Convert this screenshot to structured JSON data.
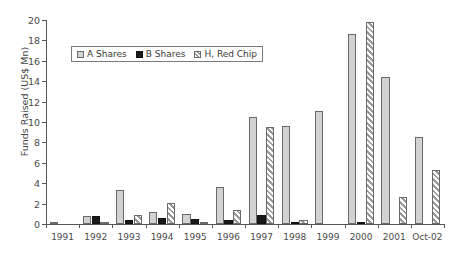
{
  "chart_data": {
    "type": "bar",
    "title": "",
    "xlabel": "",
    "ylabel": "Funds Raised (US$ Mn)",
    "ylim": [
      0,
      20
    ],
    "yticks": [
      0,
      2,
      4,
      6,
      8,
      10,
      12,
      14,
      16,
      18,
      20
    ],
    "grid": false,
    "legend_position": "top-left-inside",
    "categories": [
      "1991",
      "1992",
      "1993",
      "1994",
      "1995",
      "1996",
      "1997",
      "1998",
      "1999",
      "2000",
      "2001",
      "Oct-02"
    ],
    "series": [
      {
        "name": "A Shares",
        "swatch": "light-grey-solid",
        "color": "#d2d2d2",
        "values": [
          0.1,
          0.8,
          3.3,
          1.2,
          1.0,
          3.6,
          10.5,
          9.6,
          11.1,
          18.6,
          14.4,
          8.5
        ]
      },
      {
        "name": "B Shares",
        "swatch": "black-solid",
        "color": "#1a1a1a",
        "values": [
          0.0,
          0.8,
          0.4,
          0.6,
          0.5,
          0.4,
          0.9,
          0.2,
          0.0,
          0.1,
          0.0,
          0.0
        ]
      },
      {
        "name": "H, Red Chip",
        "swatch": "grey-hatched",
        "color": "#9a9a9a",
        "values": [
          0.0,
          0.2,
          0.9,
          2.1,
          0.2,
          1.4,
          9.5,
          0.4,
          0.0,
          19.8,
          2.6,
          5.3
        ]
      }
    ]
  },
  "legend": {
    "items": [
      {
        "label": "A Shares"
      },
      {
        "label": "B Shares"
      },
      {
        "label": "H, Red Chip"
      }
    ]
  },
  "caption": {
    "text": ""
  }
}
